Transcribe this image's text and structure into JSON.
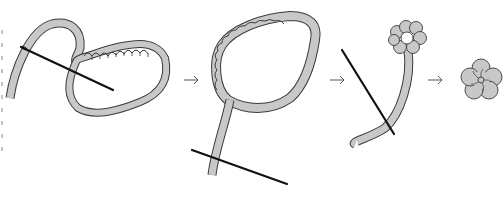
{
  "diagram": {
    "steps": [
      {
        "id": 1,
        "description": "Needle running stitch along ribbon edge, ribbon gathered into loop"
      },
      {
        "id": 2,
        "description": "Ribbon gathered into a full ring, needle through ribbon tail"
      },
      {
        "id": 3,
        "description": "Small gathered rosette at top of ribbon, needle stitching tail"
      },
      {
        "id": 4,
        "description": "Finished five-petal ribbon flower"
      }
    ],
    "connectors": [
      {
        "from": 1,
        "to": 2,
        "icon": "arrow-right-icon"
      },
      {
        "from": 2,
        "to": 3,
        "icon": "arrow-right-icon"
      },
      {
        "from": 3,
        "to": 4,
        "icon": "arrow-right-icon"
      }
    ],
    "colors": {
      "ribbon_fill": "#c8c8c8",
      "outline": "#3a3a3a",
      "needle": "#111111",
      "arrow": "#555555",
      "background": "#ffffff"
    }
  }
}
